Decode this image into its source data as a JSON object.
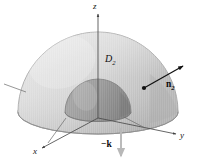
{
  "figure": {
    "name": "hemispherical-shell-region-diagram",
    "background_color": "#ffffff",
    "axes": {
      "z_label": "z",
      "y_label": "y",
      "x_label": "x",
      "axis_color": "#4a4a4a"
    },
    "region": {
      "label_text": "D",
      "label_subscript": "2",
      "outer_surface_color": "#d6d6d6",
      "outer_surface_shadow_color": "#bcbcbc",
      "inner_dome_color": "#9a9a9a",
      "inner_dome_shadow_color": "#8a8a8a",
      "base_disk_color": "#cfcfcf",
      "base_disk_edge_color": "#9d9d9d"
    },
    "normal_vector": {
      "label_text": "n",
      "label_subscript": "2",
      "arrow_color": "#111111",
      "base_point_color": "#111111"
    },
    "down_vector": {
      "label_text": "−k",
      "arrow_color": "#b8b8b8"
    },
    "leader_lines": {
      "color": "#6a6a6a",
      "count": 3
    }
  }
}
